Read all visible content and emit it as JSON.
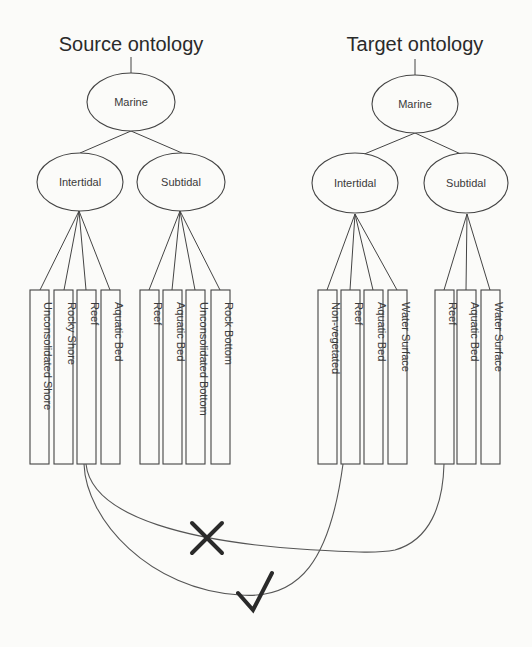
{
  "source": {
    "title": "Source ontology",
    "root": "Marine",
    "children": [
      {
        "label": "Intertidal",
        "leaves": [
          "Unconsolidated Shore",
          "Rocky Shore",
          "Reef",
          "Aquatic Bed"
        ]
      },
      {
        "label": "Subtidal",
        "leaves": [
          "Reef",
          "Aquatic Bed",
          "Unconsolidated Bottom",
          "Rock Bottom"
        ]
      }
    ]
  },
  "target": {
    "title": "Target ontology",
    "root": "Marine",
    "children": [
      {
        "label": "Intertidal",
        "leaves": [
          "Non-vegetated",
          "Reef",
          "Aquatic Bed",
          "Water Surface"
        ]
      },
      {
        "label": "Subtidal",
        "leaves": [
          "Reef",
          "Aquatic Bed",
          "Water Surface"
        ]
      }
    ]
  },
  "mappings": [
    {
      "from": "Source / Intertidal / Reef",
      "to": "Target / Subtidal / Reef",
      "status": "incorrect",
      "icon": "cross-icon"
    },
    {
      "from": "Source / Intertidal / Reef",
      "to": "Target / Intertidal / Reef",
      "status": "correct",
      "icon": "check-icon"
    }
  ]
}
